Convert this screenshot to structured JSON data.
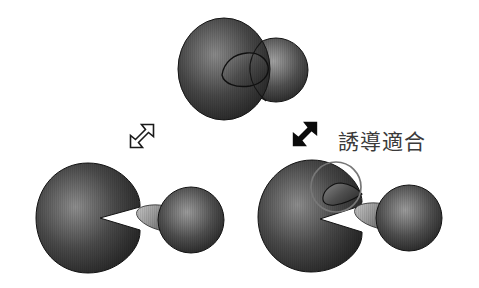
{
  "figure": {
    "background_color": "#ffffff",
    "width": 479,
    "height": 288
  },
  "label": {
    "induced_fit": "誘導適合"
  },
  "colors": {
    "enzyme_dark": "#232323",
    "enzyme_mid": "#4b4b4b",
    "enzyme_light": "#8d8d8d",
    "substrate_dark": "#2b2b2b",
    "substrate_light": "#9a9a9a",
    "tail_dark": "#5a5a5a",
    "tail_light": "#b3b3b3",
    "outline": "#111111",
    "highlight_circle": "#777777",
    "arrow_fill_white": "#ffffff",
    "arrow_fill_black": "#0b0b0b",
    "arrow_stroke": "#1a1a1a",
    "text": "#3a3a3a"
  },
  "objects": [
    {
      "id": "complex-top",
      "name": "enzyme-substrate-complex",
      "role": "bound complex of enzyme and substrate after induced fit",
      "position": {
        "x": 178,
        "y": 18,
        "width": 136,
        "height": 102
      }
    },
    {
      "id": "enzyme-left",
      "name": "enzyme-free-rigid",
      "role": "free enzyme with V-shaped active site notch",
      "position": {
        "x": 36,
        "y": 163,
        "width": 104,
        "height": 110
      }
    },
    {
      "id": "substrate-left",
      "name": "substrate-free-left",
      "role": "free substrate sphere with conical binding tail",
      "position": {
        "x": 138,
        "y": 185,
        "width": 86,
        "height": 72
      }
    },
    {
      "id": "enzyme-right",
      "name": "enzyme-induced-fit",
      "role": "enzyme showing reshaped active site highlighted by a circle",
      "position": {
        "x": 258,
        "y": 160,
        "width": 108,
        "height": 112
      }
    },
    {
      "id": "substrate-right",
      "name": "substrate-free-right",
      "role": "free substrate sphere with conical binding tail",
      "position": {
        "x": 356,
        "y": 183,
        "width": 86,
        "height": 72
      }
    },
    {
      "id": "arrow-left",
      "name": "arrow-outline-bidirectional",
      "role": "open double-headed diagonal arrow (lock-and-key association)",
      "style": "outline",
      "position": {
        "x": 123,
        "y": 117,
        "width": 38,
        "height": 38
      }
    },
    {
      "id": "arrow-right",
      "name": "arrow-solid-bidirectional",
      "role": "filled double-headed diagonal arrow (induced-fit association)",
      "style": "filled",
      "position": {
        "x": 286,
        "y": 115,
        "width": 38,
        "height": 38
      }
    },
    {
      "id": "highlight-circle",
      "name": "active-site-highlight-circle",
      "role": "circle outline marking the conformational change of the active site",
      "position": {
        "x": 311,
        "y": 162,
        "width": 50,
        "height": 50
      }
    }
  ]
}
